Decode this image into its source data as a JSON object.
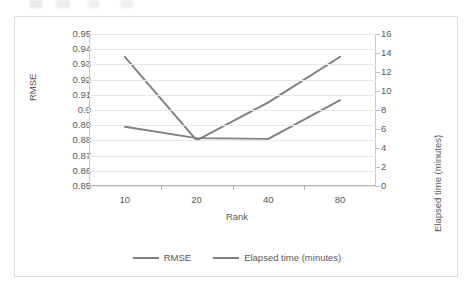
{
  "chart_data": {
    "type": "line",
    "title": "",
    "xlabel": "Rank",
    "ylabel": "RMSE",
    "y2label": "Elapsed time (minutes)",
    "categories": [
      "10",
      "20",
      "40",
      "80"
    ],
    "grid": true,
    "legend_position": "bottom",
    "axes": {
      "left": {
        "label": "RMSE",
        "min": 0.85,
        "max": 0.95,
        "step": 0.01,
        "ticks": [
          "0.95",
          "0.94",
          "0.93",
          "0.92",
          "0.91",
          "0.9",
          "0.89",
          "0.88",
          "0.87",
          "0.86",
          "0.85"
        ],
        "tick_values": [
          0.95,
          0.94,
          0.93,
          0.92,
          0.91,
          0.9,
          0.89,
          0.88,
          0.87,
          0.86,
          0.85
        ]
      },
      "right": {
        "label": "Elapsed time (minutes)",
        "min": 0,
        "max": 16,
        "step": 2,
        "ticks": [
          "16",
          "14",
          "12",
          "10",
          "8",
          "6",
          "4",
          "2",
          "0"
        ],
        "tick_values": [
          16,
          14,
          12,
          10,
          8,
          6,
          4,
          2,
          0
        ]
      },
      "x": {
        "label": "Rank",
        "ticks": [
          "10",
          "20",
          "40",
          "80"
        ]
      }
    },
    "series": [
      {
        "name": "RMSE",
        "axis": "left",
        "color": "#808080",
        "values": [
          0.889,
          0.8815,
          0.881,
          0.9065
        ]
      },
      {
        "name": "Elapsed time (minutes)",
        "axis": "right",
        "color": "#7f7f7f",
        "values": [
          13.6,
          4.8,
          8.8,
          13.6
        ]
      }
    ]
  },
  "legend": {
    "items": [
      {
        "label": "RMSE",
        "color": "#808080"
      },
      {
        "label": "Elapsed time (minutes)",
        "color": "#7f7f7f"
      }
    ]
  }
}
